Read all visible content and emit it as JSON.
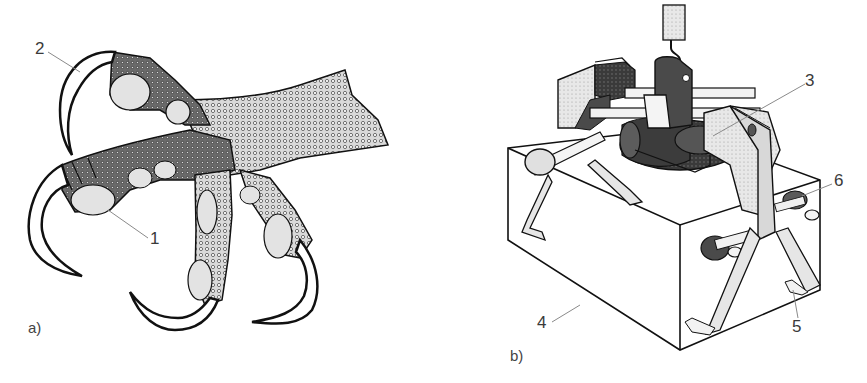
{
  "figure": {
    "panels": [
      {
        "id": "a",
        "label": "a)",
        "subject": "bird-of-prey talon (foot with four toes and claws)",
        "callouts": [
          {
            "number": "1",
            "target": "toe pad"
          },
          {
            "number": "2",
            "target": "claw"
          }
        ]
      },
      {
        "id": "b",
        "label": "b)",
        "subject": "claw-inspired mechanical gripper lifting a box",
        "callouts": [
          {
            "number": "3",
            "target": "gripper arm / actuator assembly"
          },
          {
            "number": "4",
            "target": "box (grasped object)"
          },
          {
            "number": "5",
            "target": "gripper finger tip"
          },
          {
            "number": "6",
            "target": "pivot joint"
          }
        ]
      }
    ]
  },
  "colors": {
    "line": "#111111",
    "fill_light": "#e6e6e6",
    "fill_mid": "#bdbdbd",
    "fill_dark": "#3a3a3a",
    "leader": "#8a8a8a",
    "text": "#3a3a3a"
  }
}
